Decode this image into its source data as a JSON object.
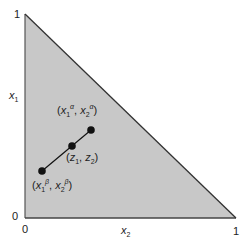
{
  "diagram": {
    "type": "simplex",
    "colors": {
      "fill": "#c8c8c8",
      "stroke": "#333333",
      "point": "#111111"
    },
    "axes": {
      "y_label": {
        "var": "x",
        "sub": "1"
      },
      "x_label": {
        "var": "x",
        "sub": "2"
      },
      "y_ticks": [
        "1",
        "0"
      ],
      "x_ticks": [
        "0",
        "1"
      ]
    },
    "points": [
      {
        "id": "alpha",
        "label_open": "(",
        "v1": "x",
        "s1": "1",
        "p1": "α",
        "sep": ", ",
        "v2": "x",
        "s2": "2",
        "p2": "α",
        "label_close": ")"
      },
      {
        "id": "z",
        "label_open": "(",
        "v1": "z",
        "s1": "1",
        "p1": "",
        "sep": ", ",
        "v2": "z",
        "s2": "2",
        "p2": "",
        "label_close": ")"
      },
      {
        "id": "beta",
        "label_open": "(",
        "v1": "x",
        "s1": "1",
        "p1": "β",
        "sep": ", ",
        "v2": "x",
        "s2": "2",
        "p2": "β",
        "label_close": ")"
      }
    ]
  }
}
